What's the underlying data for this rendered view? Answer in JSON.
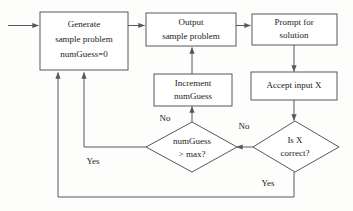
{
  "diagram": {
    "type": "flowchart",
    "canvas": {
      "width": 353,
      "height": 211,
      "background": "#fdfdfc"
    },
    "style": {
      "line_color": "#55595c",
      "text_color": "#1b1b1b",
      "node_fill": "#ffffff"
    },
    "nodes": [
      {
        "id": "generate",
        "shape": "rect",
        "lines": [
          "Generate",
          "sample problem",
          "numGuess=0"
        ]
      },
      {
        "id": "output",
        "shape": "rect",
        "lines": [
          "Output",
          "sample problem"
        ]
      },
      {
        "id": "prompt",
        "shape": "rect",
        "lines": [
          "Prompt for",
          "solution"
        ]
      },
      {
        "id": "accept",
        "shape": "rect",
        "lines": [
          "Accept input X"
        ]
      },
      {
        "id": "increment",
        "shape": "rect",
        "lines": [
          "Increment",
          "numGuess"
        ]
      },
      {
        "id": "max-check",
        "shape": "diamond",
        "lines": [
          "numGuess",
          "> max?"
        ]
      },
      {
        "id": "correct-check",
        "shape": "diamond",
        "lines": [
          "Is X",
          "correct?"
        ]
      }
    ],
    "edges": [
      {
        "id": "entry",
        "from": "",
        "to": "generate",
        "label": ""
      },
      {
        "id": "generate-to-output",
        "from": "generate",
        "to": "output",
        "label": ""
      },
      {
        "id": "output-to-prompt",
        "from": "output",
        "to": "prompt",
        "label": ""
      },
      {
        "id": "prompt-to-accept",
        "from": "prompt",
        "to": "accept",
        "label": ""
      },
      {
        "id": "accept-to-correct",
        "from": "accept",
        "to": "correct-check",
        "label": ""
      },
      {
        "id": "correct-no-to-max",
        "from": "correct-check",
        "to": "max-check",
        "label": "No"
      },
      {
        "id": "max-no-to-increment",
        "from": "max-check",
        "to": "increment",
        "label": "No"
      },
      {
        "id": "increment-to-output",
        "from": "increment",
        "to": "output",
        "label": ""
      },
      {
        "id": "max-yes-to-generate",
        "from": "max-check",
        "to": "generate",
        "label": "Yes"
      },
      {
        "id": "correct-yes-to-generate",
        "from": "correct-check",
        "to": "generate",
        "label": "Yes"
      }
    ],
    "labels": {
      "no_max": "No",
      "no_correct": "No",
      "yes_max": "Yes",
      "yes_correct": "Yes"
    }
  }
}
